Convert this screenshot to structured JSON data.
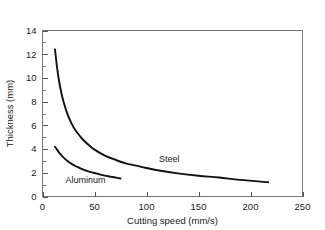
{
  "figure": {
    "background_color": "#ffffff",
    "frame_color": "#777777",
    "curve_color": "#111111",
    "text_color": "#1a1a1a"
  },
  "chart_data": {
    "type": "line",
    "title": "",
    "subtitle": "",
    "xlabel": "Cutting speed (mm/s)",
    "ylabel": "Thickness (mm)",
    "xlim": [
      0,
      250
    ],
    "ylim": [
      0,
      14
    ],
    "xticks": [
      0,
      50,
      100,
      150,
      200,
      250
    ],
    "xtick_labels": [
      "0",
      "50",
      "100",
      "150",
      "200",
      "250"
    ],
    "yticks": [
      0,
      2,
      4,
      6,
      8,
      10,
      12,
      14
    ],
    "ytick_labels": [
      "0",
      "2",
      "4",
      "6",
      "8",
      "10",
      "12",
      "14"
    ],
    "y_minor_ticks": [
      1,
      3,
      5,
      7,
      9,
      11,
      13
    ],
    "grid": false,
    "legend": "inline-annotations",
    "legend_position": "inline",
    "series": [
      {
        "name": "Steel",
        "label_text": "Steel",
        "label_x": 112,
        "label_y": 3.15,
        "x": [
          12,
          14,
          16,
          18,
          20,
          24,
          28,
          32,
          36,
          40,
          45,
          50,
          60,
          70,
          80,
          90,
          100,
          115,
          130,
          150,
          170,
          190,
          217
        ],
        "y": [
          12.4,
          10.9,
          9.7,
          8.8,
          8.05,
          6.95,
          6.15,
          5.55,
          5.1,
          4.7,
          4.3,
          3.95,
          3.45,
          3.1,
          2.8,
          2.6,
          2.4,
          2.15,
          1.95,
          1.75,
          1.6,
          1.4,
          1.2
        ]
      },
      {
        "name": "Aluminum",
        "label_text": "Aluminum",
        "label_x": 22,
        "label_y": 1.35,
        "x": [
          12,
          14,
          16,
          18,
          20,
          24,
          28,
          32,
          36,
          40,
          45,
          50,
          55,
          60,
          65,
          70,
          75
        ],
        "y": [
          4.2,
          3.95,
          3.7,
          3.5,
          3.3,
          3.0,
          2.75,
          2.55,
          2.4,
          2.25,
          2.1,
          1.98,
          1.86,
          1.76,
          1.68,
          1.6,
          1.52
        ]
      }
    ]
  },
  "annotations": {
    "steel_label": "Steel",
    "aluminum_label": "Aluminum"
  }
}
